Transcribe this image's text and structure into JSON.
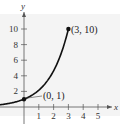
{
  "chart_data": {
    "type": "line",
    "title": "",
    "xlabel": "x",
    "ylabel": "y",
    "xlim": [
      -3,
      5.6
    ],
    "ylim": [
      0,
      11.5
    ],
    "x_ticks": [
      1,
      2,
      3,
      4,
      5
    ],
    "y_ticks": [
      2,
      4,
      6,
      8,
      10
    ],
    "grid": false,
    "series": [
      {
        "name": "f(x) = 10^(x/3)",
        "x": [
          -3,
          -2,
          -1,
          0,
          1,
          2,
          3
        ],
        "values": [
          0.1,
          0.22,
          0.46,
          1,
          2.15,
          4.64,
          10
        ]
      }
    ],
    "annotations": [
      {
        "label": "(0, 1)",
        "x": 0,
        "y": 1
      },
      {
        "label": "(3, 10)",
        "x": 3,
        "y": 10
      }
    ]
  },
  "colors": {
    "plot_bg": "#f4f4f4",
    "curve": "#111111",
    "axis": "#555555"
  }
}
